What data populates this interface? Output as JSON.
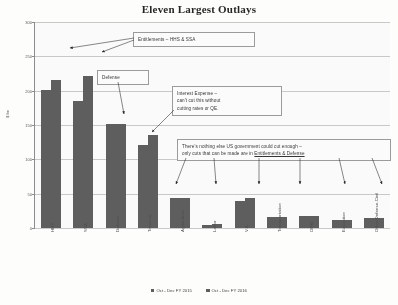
{
  "chart_data": {
    "type": "bar",
    "title": "Eleven Largest Outlays",
    "xlabel": "",
    "ylabel": "$ bn",
    "ylim": [
      0,
      300
    ],
    "yticks": [
      0,
      50,
      100,
      150,
      200,
      250,
      300
    ],
    "ytick_labels": [
      "0",
      "50",
      "100",
      "150",
      "200",
      "250",
      "300"
    ],
    "grid": true,
    "legend_position": "bottom",
    "categories": [
      "HHS",
      "SSA",
      "Defense",
      "Treasury",
      "Agriculture",
      "Labor",
      "V.A.",
      "Transportation",
      "OPM",
      "Education",
      "Other Defense-Civil"
    ],
    "series": [
      {
        "name": "Oct - Dec FY 2015",
        "color": "#5a5a5a",
        "values": [
          201,
          185,
          151,
          121,
          43,
          5,
          40,
          16,
          18,
          11,
          14
        ]
      },
      {
        "name": "Oct - Dec FY 2016",
        "color": "#595959",
        "values": [
          216,
          221,
          151,
          135,
          44,
          6,
          44,
          16,
          18,
          11,
          15
        ]
      }
    ],
    "annotations": [
      {
        "id": "entitlements",
        "text": "Entitlements – HHS & SSA",
        "targets": [
          "HHS",
          "SSA"
        ]
      },
      {
        "id": "defense",
        "text": "Defense",
        "targets": [
          "Defense"
        ]
      },
      {
        "id": "interest",
        "lines": [
          "Interest Expense –",
          "can't cut this without",
          "cutting rates or QE."
        ],
        "targets": [
          "Treasury"
        ]
      },
      {
        "id": "nothing",
        "line1": "There's nothing else US government could cut enough –",
        "line2_pre": "only cuts that can be made are in ",
        "line2_underline": "Entitlements & Defense",
        "targets": [
          "Agriculture",
          "V.A.",
          "Transportation",
          "OPM",
          "Education",
          "Other Defense-Civil"
        ]
      }
    ]
  },
  "chart": {
    "title": "Eleven Largest Outlays",
    "y_axis_title": "$ bn"
  }
}
